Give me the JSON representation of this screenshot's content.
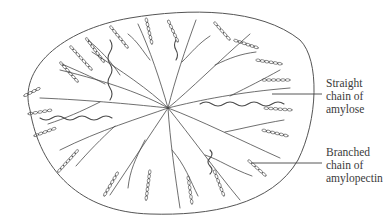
{
  "figure": {
    "granule_outline": {
      "stroke": "#555555",
      "path": "M 30 110 C 18 70, 60 30, 130 18 C 190 8, 260 8, 300 40 C 320 60, 318 120, 298 160 C 272 205, 210 216, 150 214 C 80 212, 40 170, 30 110 Z"
    },
    "labels": [
      {
        "id": "amylose",
        "lines": [
          "Straight",
          "chain of",
          "amylose"
        ],
        "leader": {
          "x1": 272,
          "y1": 94,
          "x2": 322,
          "y2": 94
        }
      },
      {
        "id": "amylopectin",
        "lines": [
          "Branched",
          "chain of",
          "amylopectin"
        ],
        "leader": {
          "x1": 252,
          "y1": 163,
          "x2": 322,
          "y2": 163
        }
      }
    ],
    "strands": {
      "color": "#4a4a4a",
      "center": {
        "x": 168,
        "y": 108
      },
      "branches": [
        "M 168 108 C 150 90, 120 70, 92 52",
        "M 120 75 C 110 60, 100 50, 88 40",
        "M 168 108 C 160 80, 150 50, 138 24",
        "M 150 60 C 142 50, 138 42, 128 34",
        "M 168 108 C 175 80, 185 50, 196 20",
        "M 182 62 C 192 52, 198 44, 210 36",
        "M 168 108 C 190 90, 220 60, 250 34",
        "M 215 65 C 230 58, 240 54, 256 52",
        "M 168 108 C 200 100, 240 92, 290 88",
        "M 230 96 C 250 86, 262 80, 280 70",
        "M 168 108 C 200 120, 240 140, 280 158",
        "M 225 132 C 245 128, 260 124, 284 120",
        "M 168 108 C 190 135, 215 170, 240 200",
        "M 205 155 C 220 160, 230 168, 252 176",
        "M 168 108 C 170 140, 175 175, 180 208",
        "M 172 150 C 185 165, 190 180, 198 196",
        "M 168 108 C 150 135, 130 165, 110 195",
        "M 145 140 C 135 160, 130 170, 128 188",
        "M 168 108 C 140 118, 100 130, 60 150",
        "M 115 126 C 100 140, 90 150, 76 166",
        "M 168 108 C 140 105, 90 100, 40 98",
        "M 100 102 C 80 112, 66 118, 48 124",
        "M 168 108 C 145 95, 110 82, 60 70",
        "M 105 84 C 90 76, 80 72, 62 64"
      ],
      "bead_chains": [
        {
          "x1": 60,
          "y1": 62,
          "x2": 78,
          "y2": 82
        },
        {
          "x1": 70,
          "y1": 46,
          "x2": 92,
          "y2": 70
        },
        {
          "x1": 86,
          "y1": 38,
          "x2": 104,
          "y2": 62
        },
        {
          "x1": 110,
          "y1": 26,
          "x2": 128,
          "y2": 48
        },
        {
          "x1": 146,
          "y1": 18,
          "x2": 152,
          "y2": 44
        },
        {
          "x1": 168,
          "y1": 20,
          "x2": 178,
          "y2": 42
        },
        {
          "x1": 214,
          "y1": 22,
          "x2": 230,
          "y2": 40
        },
        {
          "x1": 234,
          "y1": 40,
          "x2": 258,
          "y2": 48
        },
        {
          "x1": 256,
          "y1": 60,
          "x2": 282,
          "y2": 64
        },
        {
          "x1": 262,
          "y1": 80,
          "x2": 290,
          "y2": 80
        },
        {
          "x1": 264,
          "y1": 108,
          "x2": 292,
          "y2": 110
        },
        {
          "x1": 262,
          "y1": 130,
          "x2": 288,
          "y2": 136
        },
        {
          "x1": 248,
          "y1": 160,
          "x2": 266,
          "y2": 176
        },
        {
          "x1": 214,
          "y1": 170,
          "x2": 224,
          "y2": 196
        },
        {
          "x1": 188,
          "y1": 176,
          "x2": 192,
          "y2": 204
        },
        {
          "x1": 150,
          "y1": 170,
          "x2": 146,
          "y2": 200
        },
        {
          "x1": 118,
          "y1": 172,
          "x2": 104,
          "y2": 196
        },
        {
          "x1": 78,
          "y1": 150,
          "x2": 58,
          "y2": 172
        },
        {
          "x1": 56,
          "y1": 128,
          "x2": 34,
          "y2": 136
        },
        {
          "x1": 52,
          "y1": 110,
          "x2": 28,
          "y2": 114
        },
        {
          "x1": 40,
          "y1": 88,
          "x2": 24,
          "y2": 96
        }
      ],
      "wavy_chains": [
        "M 110 40 q 4 6 0 12 q -4 6 0 12 q 4 6 0 12 q -4 6 0 12 q 4 6 0 12",
        "M 200 104 q 6 -4 12 0 q 6 4 12 0 q 6 -4 12 0 q 6 4 12 0 q 6 -4 12 0 q 6 4 12 0 q 6 -4 12 0",
        "M 40 118 q 6 4 12 0 q 6 -4 12 0 q 6 4 12 0 q 6 -4 12 0 q 6 4 12 0 q 6 -4 12 0",
        "M 176 60 q 3 -5 0 -10 q -3 -5 0 -10",
        "M 210 150 q 4 4 0 8 q -4 4 0 8 q 4 4 0 8"
      ]
    }
  }
}
